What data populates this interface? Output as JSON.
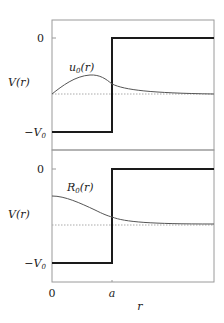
{
  "figure": {
    "panels": [
      {
        "id": "top",
        "ylabel": "V(r)",
        "ytick_zero": "0",
        "ytick_well": "−V",
        "ytick_well_sub": "0",
        "curve_label": "u",
        "curve_label_sub": "0",
        "curve_label_arg": "(r)"
      },
      {
        "id": "bottom",
        "ylabel": "V(r)",
        "ytick_zero": "0",
        "ytick_well": "−V",
        "ytick_well_sub": "0",
        "curve_label": "R",
        "curve_label_sub": "0",
        "curve_label_arg": "(r)"
      }
    ],
    "xaxis": {
      "label": "r",
      "ticks": [
        "0",
        "a"
      ]
    },
    "colors": {
      "frame": "#9a9a9a",
      "potential": "#1a1a1a",
      "curve": "#555555",
      "energy_level": "#aaaaaa"
    }
  }
}
